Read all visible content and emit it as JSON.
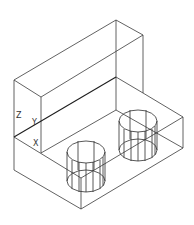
{
  "view": {
    "description": "Isometric wireframe of an L-shaped block with two cylindrical holes",
    "background": "#ffffff",
    "line_color": "#3a3a3a"
  },
  "ucs_icon": {
    "z_label": "Z",
    "y_label": "Y",
    "x_label": "X"
  }
}
